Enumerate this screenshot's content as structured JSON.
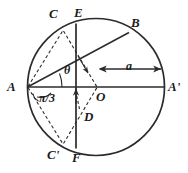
{
  "figure": {
    "kind": "geometry-diagram",
    "width": 188,
    "height": 173,
    "background_color": "#ffffff",
    "stroke_color": "#2b2b2b",
    "label_color": "#1a1a1a"
  },
  "circle": {
    "center_label": "O",
    "center_x": 96,
    "center_y": 87,
    "radius": 68
  },
  "points": {
    "A": {
      "label": "A",
      "x": 27,
      "y": 87,
      "label_x": 7,
      "label_y": 80
    },
    "A_prime": {
      "label": "A'",
      "x": 164,
      "y": 87,
      "label_x": 168,
      "label_y": 80
    },
    "B": {
      "label": "B",
      "x": 128,
      "y": 33,
      "label_x": 132,
      "label_y": 18
    },
    "C": {
      "label": "C",
      "x": 63,
      "y": 30,
      "label_x": 50,
      "label_y": 9
    },
    "C_prime": {
      "label": "C'",
      "x": 63,
      "y": 144,
      "label_x": 49,
      "label_y": 147
    },
    "D": {
      "label": "D",
      "x": 80,
      "y": 111,
      "label_x": 83,
      "label_y": 110
    },
    "E": {
      "label": "E",
      "x": 76,
      "y": 23,
      "label_x": 78,
      "label_y": 8
    },
    "F": {
      "label": "F",
      "x": 76,
      "y": 149,
      "label_x": 74,
      "label_y": 152
    },
    "O": {
      "label": "O",
      "x": 96,
      "y": 87,
      "label_x": 96,
      "label_y": 90
    }
  },
  "angles": {
    "theta": {
      "label": "θ",
      "label_x": 67,
      "label_y": 66
    },
    "pi_over_3": {
      "label": "π/3",
      "label_x": 42,
      "label_y": 91
    }
  },
  "measures": {
    "radius_label": {
      "label": "a",
      "label_x": 127,
      "label_y": 65
    }
  },
  "elements": {
    "circle_outline": "circle-outline",
    "diameter_AA_prime": "diameter-a-aprime",
    "chord_EF": "vertical-chord-ef",
    "chord_AB": "chord-a-b",
    "dashed_AC": "dashed-segment-a-c",
    "dashed_AC_prime": "dashed-segment-a-cprime",
    "dashed_CD": "dashed-segment-c-d",
    "dashed_C_prime_O": "dashed-segment-cprime-o",
    "radius_arrow": "radius-dimension-arrow",
    "d_arrow": "d-direction-arrow"
  }
}
